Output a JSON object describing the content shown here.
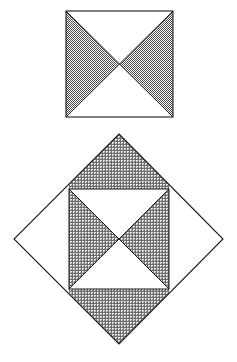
{
  "document": {
    "title": "Geometric figure: shaded square and inscribed rotated square",
    "background_color": "#ffffff",
    "line_color": "#1a1a1a",
    "shade_color": "#9a9a9a",
    "shade_pattern": "crosshatch-halftone"
  },
  "figures": [
    {
      "id": "top-square",
      "name": "Square with shaded bowtie (left and right triangles)",
      "shape": "square",
      "bounds": {
        "x": 66,
        "y": 11,
        "width": 107,
        "height": 106
      },
      "vertices": [
        {
          "label": "top-left",
          "x": 66,
          "y": 11
        },
        {
          "label": "top-right",
          "x": 173,
          "y": 11
        },
        {
          "label": "bottom-right",
          "x": 173,
          "y": 117
        },
        {
          "label": "bottom-left",
          "x": 66,
          "y": 117
        }
      ],
      "center": {
        "x": 119.5,
        "y": 64
      },
      "diagonals": [
        {
          "from": "top-left",
          "to": "bottom-right"
        },
        {
          "from": "top-right",
          "to": "bottom-left"
        }
      ],
      "regions": [
        {
          "name": "top-triangle",
          "shaded": false
        },
        {
          "name": "left-triangle",
          "shaded": true
        },
        {
          "name": "right-triangle",
          "shaded": true
        },
        {
          "name": "bottom-triangle",
          "shaded": false
        }
      ]
    },
    {
      "id": "bottom-diamond",
      "name": "Rotated square (diamond) containing inscribed square with shaded bowtie",
      "shape": "rotated-square",
      "vertices": [
        {
          "label": "top",
          "x": 119,
          "y": 134
        },
        {
          "label": "right",
          "x": 223,
          "y": 239
        },
        {
          "label": "bottom",
          "x": 119,
          "y": 344
        },
        {
          "label": "left",
          "x": 14,
          "y": 239
        }
      ],
      "center": {
        "x": 119,
        "y": 239
      },
      "inner_square": {
        "id": "inner-square",
        "bounds": {
          "x": 69,
          "y": 189,
          "width": 100,
          "height": 100
        },
        "vertices": [
          {
            "label": "top-left",
            "x": 69,
            "y": 189
          },
          {
            "label": "top-right",
            "x": 169,
            "y": 189
          },
          {
            "label": "bottom-right",
            "x": 169,
            "y": 289
          },
          {
            "label": "bottom-left",
            "x": 69,
            "y": 289
          }
        ],
        "center": {
          "x": 119,
          "y": 239
        },
        "regions": [
          {
            "name": "top-triangle",
            "shaded": false
          },
          {
            "name": "left-triangle",
            "shaded": true
          },
          {
            "name": "right-triangle",
            "shaded": true
          },
          {
            "name": "bottom-triangle",
            "shaded": false
          }
        ]
      },
      "outer_regions": [
        {
          "name": "upper-region",
          "shaded": true
        },
        {
          "name": "right-region",
          "shaded": false
        },
        {
          "name": "lower-region",
          "shaded": true
        },
        {
          "name": "left-region",
          "shaded": false
        }
      ]
    }
  ]
}
